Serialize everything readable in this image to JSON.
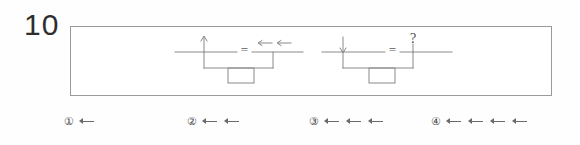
{
  "question": {
    "number": "10",
    "type": "balance-scale-equation-multiple-choice"
  },
  "panel": {
    "label": "balance-diagram-panel",
    "equations": [
      {
        "id": "equation-1",
        "left_side": {
          "symbol": "up-arrow",
          "count": 1,
          "description": "one upward arrow on left pan"
        },
        "operator": "=",
        "right_side": {
          "symbol": "left-arrow",
          "count": 2,
          "description": "two leftward arrows on right pan"
        }
      },
      {
        "id": "equation-2",
        "left_side": {
          "symbol": "down-arrow",
          "count": 1,
          "description": "one downward arrow on left pan"
        },
        "operator": "=",
        "right_side": {
          "symbol": "?",
          "count": 1,
          "description": "unknown quantity marked with question mark"
        }
      }
    ],
    "unknown_marker": "?",
    "equals_sign": "="
  },
  "options": [
    {
      "id": "option-1",
      "number": "①",
      "arrow_count": 1,
      "arrow_symbol": "left-arrow"
    },
    {
      "id": "option-2",
      "number": "②",
      "arrow_count": 2,
      "arrow_symbol": "left-arrow"
    },
    {
      "id": "option-3",
      "number": "③",
      "arrow_count": 3,
      "arrow_symbol": "left-arrow"
    },
    {
      "id": "option-4",
      "number": "④",
      "arrow_count": 4,
      "arrow_symbol": "left-arrow"
    }
  ],
  "colors": {
    "ink": "#3a3a3a",
    "line": "#8a8a8a",
    "frame": "#9a9a9a",
    "arrow": "#6a6a6a",
    "background": "#ffffff"
  }
}
